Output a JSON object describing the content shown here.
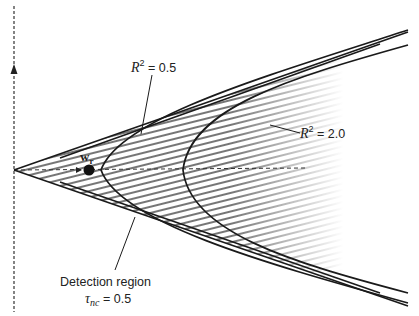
{
  "diagram": {
    "type": "detection-region-geometry",
    "colors": {
      "line": "#1a1a1a",
      "hatch": "#333333",
      "background": "#ffffff"
    },
    "axis": {
      "orientation": "vertical",
      "style": "dashed",
      "arrow": "up"
    },
    "point": {
      "label_main": "w",
      "label_sub": "r",
      "icon": "filled-circle"
    },
    "labels": {
      "r2_low": {
        "prefix": "R",
        "sup": "2",
        "suffix": " = 0.5"
      },
      "r2_high": {
        "prefix": "R",
        "sup": "2",
        "suffix": " = 2.0"
      },
      "detection_region": "Detection region",
      "threshold": {
        "symbol": "τ",
        "sub": "nc",
        "suffix": " = 0.5"
      }
    },
    "curves": [
      {
        "name": "detection-cone-boundary",
        "shape": "cone",
        "threshold": "0.5"
      },
      {
        "name": "r2-0.5-contour",
        "shape": "hyperbola",
        "R2": 0.5
      },
      {
        "name": "r2-2.0-contour",
        "shape": "hyperbola",
        "R2": 2.0
      }
    ]
  }
}
